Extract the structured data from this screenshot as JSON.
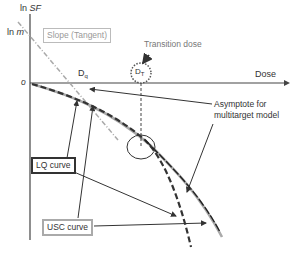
{
  "diagram": {
    "y_axis_label": "ln",
    "y_axis_label_var": "SF",
    "y_tick_ln_m": "ln",
    "y_tick_ln_m_var": "m",
    "origin_label": "o",
    "x_axis_label": "Dose",
    "slope_label": "Slope (Tangent)",
    "dq_label": "D",
    "dq_sub": "q",
    "dt_label": "D",
    "dt_sub": "T",
    "transition_label": "Transition dose",
    "asymptote_label_line1": "Asymptote for",
    "asymptote_label_line2": "multitarget model",
    "lq_label": "LQ curve",
    "usc_label": "USC curve",
    "colors": {
      "axis": "#444444",
      "tangent": "#aaaaaa",
      "lq_curve": "#333333",
      "usc_curve": "#999999",
      "lq_box_border": "#333333",
      "usc_box_border": "#aaaaaa"
    }
  }
}
